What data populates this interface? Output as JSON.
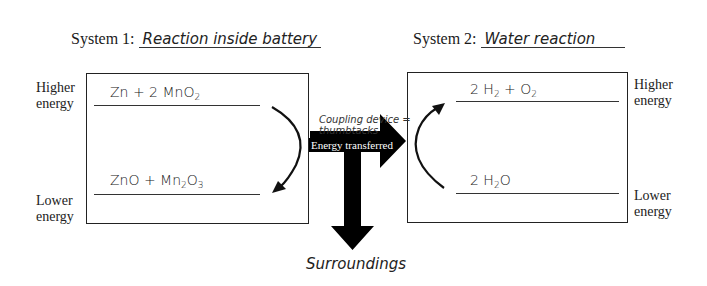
{
  "system1": {
    "title_prefix": "System 1:",
    "name": "Reaction inside battery",
    "higher_label": [
      "Higher",
      "energy"
    ],
    "lower_label": [
      "Lower",
      "energy"
    ],
    "higher_species": {
      "parts": [
        "Zn + 2 MnO",
        "2",
        ""
      ]
    },
    "lower_species": {
      "parts": [
        "ZnO + Mn",
        "2",
        "O",
        "3"
      ]
    },
    "arrow_direction": "down"
  },
  "system2": {
    "title_prefix": "System 2:",
    "name": "Water reaction",
    "higher_label": [
      "Higher",
      "energy"
    ],
    "lower_label": [
      "Lower",
      "energy"
    ],
    "higher_species": {
      "parts": [
        "2 H",
        "2",
        " + O",
        "2"
      ]
    },
    "lower_species": {
      "parts": [
        "2 H",
        "2",
        "O"
      ]
    },
    "arrow_direction": "up"
  },
  "coupling": {
    "label_line1": "Coupling device =",
    "label_line2": "thumbtacks",
    "energy_label": "Energy transferred",
    "surroundings_label": "Surroundings"
  },
  "colors": {
    "ink": "#1a1a1a",
    "arrow_fill": "#000000",
    "background": "#ffffff"
  }
}
